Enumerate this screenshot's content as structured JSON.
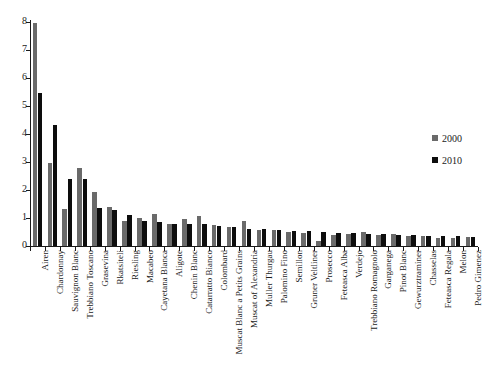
{
  "chart_data": {
    "type": "bar",
    "title": "",
    "subtitle": "",
    "xlabel": "",
    "ylabel": "",
    "ylim": [
      0,
      8
    ],
    "yticks": [
      0,
      1,
      2,
      3,
      4,
      5,
      6,
      7,
      8
    ],
    "ytick_labels": [
      "0",
      "1",
      "2",
      "3",
      "4",
      "5",
      "6",
      "7",
      "8"
    ],
    "grid": false,
    "legend_position": "right",
    "colors": {
      "series_2000": "#6a6a6a",
      "series_2010": "#0d0d0d",
      "axis": "#1a1a1a",
      "background": "#ffffff"
    },
    "categories": [
      "Airen",
      "Chardonnay",
      "Sauvignon Blanc",
      "Trebbiano Toscano",
      "Grasevina",
      "Rkatsiteli",
      "Riesling",
      "Macabeo",
      "Cayetana Blanca",
      "Aligote",
      "Chenin Blanc",
      "Catarratto Bianco",
      "Colombard",
      "Muscat Blanc a Petits Grains",
      "Muscat of Alexandria",
      "Muller Thurgau",
      "Palomino Fino",
      "Semillon",
      "Gruner Veltliner",
      "Prosecco",
      "Feteasca Alba",
      "Verdejo",
      "Trebbiano Romagnolo",
      "Garganega",
      "Pinot Blanc",
      "Gewurztraminer",
      "Chasselas",
      "Feteasca Regala",
      "Melon",
      "Pedro Gimenez"
    ],
    "series": [
      {
        "name": "2000",
        "color": "#6a6a6a",
        "values": [
          7.95,
          2.97,
          1.33,
          2.8,
          1.92,
          1.38,
          0.89,
          1.0,
          1.16,
          0.77,
          0.95,
          1.07,
          0.76,
          0.67,
          0.88,
          0.56,
          0.56,
          0.49,
          0.47,
          0.19,
          0.41,
          0.44,
          0.49,
          0.4,
          0.43,
          0.36,
          0.34,
          0.28,
          0.3,
          0.31
        ]
      },
      {
        "name": "2010",
        "color": "#0d0d0d",
        "values": [
          5.47,
          4.31,
          2.41,
          2.39,
          1.34,
          1.3,
          1.09,
          0.91,
          0.87,
          0.8,
          0.78,
          0.78,
          0.72,
          0.68,
          0.62,
          0.6,
          0.58,
          0.55,
          0.52,
          0.5,
          0.47,
          0.45,
          0.43,
          0.42,
          0.41,
          0.39,
          0.36,
          0.35,
          0.34,
          0.33
        ]
      }
    ]
  },
  "legend": {
    "items": [
      {
        "label": "2000",
        "color": "#6a6a6a"
      },
      {
        "label": "2010",
        "color": "#0d0d0d"
      }
    ]
  }
}
